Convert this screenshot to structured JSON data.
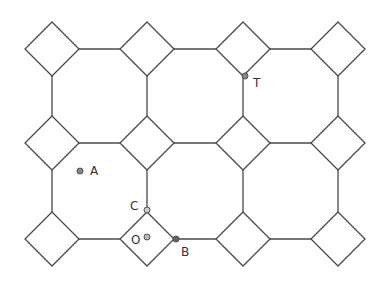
{
  "diagram": {
    "type": "4.8.8 tiling (squares and octagons)",
    "lattice": {
      "columns_x": [
        52,
        147,
        243,
        338
      ],
      "rows_y": [
        49,
        143,
        239
      ],
      "half_diagonal": 27
    },
    "points": [
      {
        "id": "T",
        "label": "T",
        "x": 245,
        "y": 76,
        "fill": "#888888",
        "label_dx": 8,
        "label_dy": 11
      },
      {
        "id": "A",
        "label": "A",
        "x": 80,
        "y": 171,
        "fill": "#888888",
        "label_dx": 10,
        "label_dy": 4
      },
      {
        "id": "C",
        "label": "C",
        "x": 147,
        "y": 210,
        "fill": "#cccccc",
        "label_dx": -17,
        "label_dy": 0
      },
      {
        "id": "O",
        "label": "O",
        "x": 147,
        "y": 237,
        "fill": "#bbbbbb",
        "label_dx": -16,
        "label_dy": 7
      },
      {
        "id": "B",
        "label": "B",
        "x": 176,
        "y": 239,
        "fill": "#666666",
        "label_dx": 5,
        "label_dy": 17
      }
    ]
  }
}
